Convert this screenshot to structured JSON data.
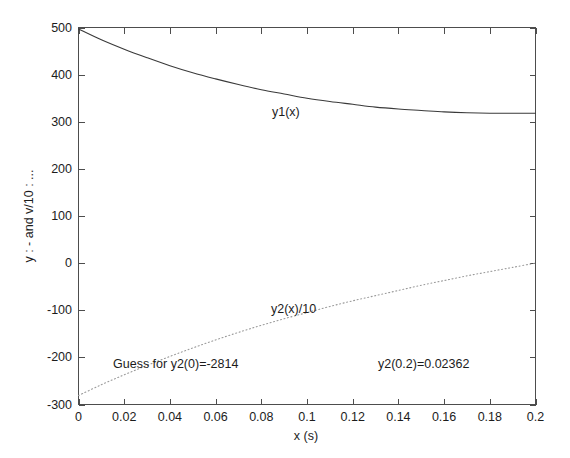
{
  "figure": {
    "background": "#ffffff",
    "axes_color": "#4d4d4d",
    "text_color": "#1c1c1c"
  },
  "chart_data": {
    "type": "line",
    "title": "",
    "xlabel": "x (s)",
    "ylabel": "y : -  and v/10 : ...",
    "xlim": [
      0,
      0.2
    ],
    "ylim": [
      -300,
      500
    ],
    "grid": false,
    "legend": "none (inline curve labels)",
    "xticks": [
      "0",
      "0.02",
      "0.04",
      "0.06",
      "0.08",
      "0.1",
      "0.12",
      "0.14",
      "0.16",
      "0.18",
      "0.2"
    ],
    "xtick_values": [
      0,
      0.02,
      0.04,
      0.06,
      0.08,
      0.1,
      0.12,
      0.14,
      0.16,
      0.18,
      0.2
    ],
    "yticks": [
      "500",
      "400",
      "300",
      "200",
      "100",
      "0",
      "-100",
      "-200",
      "-300"
    ],
    "ytick_values": [
      500,
      400,
      300,
      200,
      100,
      0,
      -100,
      -200,
      -300
    ],
    "series": [
      {
        "name": "y1(x)",
        "style": "solid",
        "color": "#3a3a3a",
        "label_text": "y1(x)",
        "x": [
          0,
          0.01,
          0.02,
          0.03,
          0.04,
          0.05,
          0.06,
          0.07,
          0.08,
          0.09,
          0.1,
          0.11,
          0.12,
          0.13,
          0.14,
          0.15,
          0.16,
          0.17,
          0.18,
          0.19,
          0.2
        ],
        "values": [
          497,
          474,
          454,
          436,
          419,
          404,
          391,
          379,
          368,
          359,
          350,
          343,
          337,
          331,
          327,
          324,
          321,
          319,
          318,
          318,
          318
        ]
      },
      {
        "name": "y2(x)/10",
        "style": "dotted",
        "color": "#9a9a9a",
        "label_text": "y2(x)/10",
        "x": [
          0,
          0.01,
          0.02,
          0.03,
          0.04,
          0.05,
          0.06,
          0.07,
          0.08,
          0.09,
          0.1,
          0.11,
          0.12,
          0.13,
          0.14,
          0.15,
          0.16,
          0.17,
          0.18,
          0.19,
          0.2
        ],
        "values": [
          -281,
          -258,
          -237,
          -217,
          -198,
          -180,
          -163,
          -147,
          -132,
          -118,
          -105,
          -92,
          -80,
          -69,
          -58,
          -47,
          -37,
          -27,
          -18,
          -9,
          0
        ]
      }
    ],
    "annotations": [
      {
        "text": "Guess for y2(0)=-2814",
        "x": 0.015,
        "y": -205
      },
      {
        "text": "y2(0.2)=0.02362",
        "x": 0.125,
        "y": -205
      }
    ]
  },
  "labels": {
    "y1_curve": "y1(x)",
    "y2_curve": "y2(x)/10",
    "guess_note": "Guess for y2(0)=-2814",
    "result_note": "y2(0.2)=0.02362",
    "x_axis_title": "x (s)",
    "y_axis_title": "y : -  and v/10 : ..."
  },
  "ticks": {
    "x": [
      "0",
      "0.02",
      "0.04",
      "0.06",
      "0.08",
      "0.1",
      "0.12",
      "0.14",
      "0.16",
      "0.18",
      "0.2"
    ],
    "y": [
      "500",
      "400",
      "300",
      "200",
      "100",
      "0",
      "-100",
      "-200",
      "-300"
    ]
  }
}
